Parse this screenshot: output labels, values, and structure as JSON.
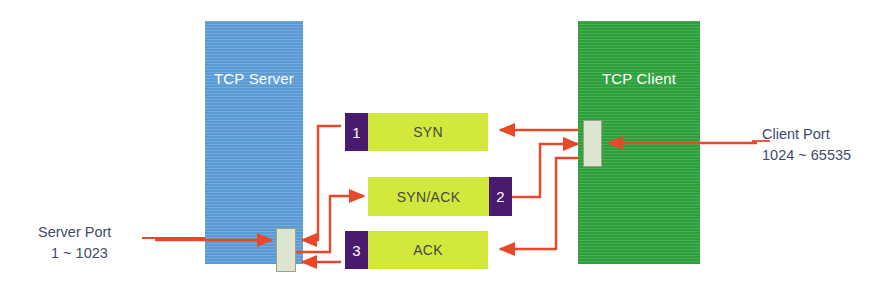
{
  "diagram": {
    "nodes": {
      "server": {
        "label": "TCP Server",
        "color": "#5b9bd5"
      },
      "client": {
        "label": "TCP Client",
        "color": "#2da03c"
      }
    },
    "ports": {
      "server": {
        "name": "server-port",
        "color": "#dde4cf"
      },
      "client": {
        "name": "client-port",
        "color": "#dde4cf"
      }
    },
    "packets": [
      {
        "step": "1",
        "label": "SYN",
        "num_side": "left",
        "direction": "client-to-server",
        "tab_color": "#4a1a6e",
        "body_color": "#d2e83c"
      },
      {
        "step": "2",
        "label": "SYN/ACK",
        "num_side": "right",
        "direction": "server-to-client",
        "tab_color": "#4a1a6e",
        "body_color": "#d2e83c"
      },
      {
        "step": "3",
        "label": "ACK",
        "num_side": "left",
        "direction": "client-to-server",
        "tab_color": "#4a1a6e",
        "body_color": "#d2e83c"
      }
    ],
    "annotations": {
      "server_port": {
        "title": "Server Port",
        "range": "1 ~ 1023"
      },
      "client_port": {
        "title": "Client Port",
        "range": "1024 ~ 65535"
      }
    },
    "connector_color": "#e8472a"
  }
}
